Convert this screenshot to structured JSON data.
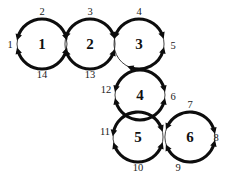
{
  "figure": {
    "background_color": "#ffffff",
    "ink_color": "#0d0d0d",
    "width": 226,
    "height": 182,
    "circle_radius": 25,
    "node_font_size": 15,
    "label_font_size": 10.5
  },
  "circles": [
    {
      "id": "c1",
      "label": "1",
      "cx": 42,
      "cy": 44,
      "r": 25
    },
    {
      "id": "c2",
      "label": "2",
      "cx": 90,
      "cy": 44,
      "r": 25
    },
    {
      "id": "c3",
      "label": "3",
      "cx": 139,
      "cy": 44,
      "r": 25
    },
    {
      "id": "c4",
      "label": "4",
      "cx": 140,
      "cy": 95,
      "r": 25
    },
    {
      "id": "c5",
      "label": "5",
      "cx": 138,
      "cy": 137,
      "r": 25
    },
    {
      "id": "c6",
      "label": "6",
      "cx": 190,
      "cy": 137,
      "r": 25
    }
  ],
  "edge_labels": [
    {
      "id": "e1",
      "label": "1",
      "x": 10,
      "y": 44,
      "circle": "c1",
      "side": "left"
    },
    {
      "id": "e2",
      "label": "2",
      "x": 42,
      "y": 11,
      "circle": "c1",
      "side": "top"
    },
    {
      "id": "e3",
      "label": "3",
      "x": 90,
      "y": 11,
      "circle": "c2",
      "side": "top"
    },
    {
      "id": "e4",
      "label": "4",
      "x": 139,
      "y": 11,
      "circle": "c3",
      "side": "top"
    },
    {
      "id": "e5",
      "label": "5",
      "x": 173,
      "y": 45,
      "circle": "c3",
      "side": "right"
    },
    {
      "id": "e6",
      "label": "6",
      "x": 173,
      "y": 96,
      "circle": "c4",
      "side": "right"
    },
    {
      "id": "e7",
      "label": "7",
      "x": 190,
      "y": 104,
      "circle": "c6",
      "side": "top"
    },
    {
      "id": "e8",
      "label": "8",
      "x": 216,
      "y": 137,
      "circle": "c6",
      "side": "right"
    },
    {
      "id": "e9",
      "label": "9",
      "x": 178,
      "y": 167,
      "circle": "c6",
      "side": "bottom"
    },
    {
      "id": "e10",
      "label": "10",
      "x": 138,
      "y": 167,
      "circle": "c5",
      "side": "bottom"
    },
    {
      "id": "e11",
      "label": "11",
      "x": 105,
      "y": 131,
      "circle": "c5",
      "side": "left"
    },
    {
      "id": "e12",
      "label": "12",
      "x": 106,
      "y": 89,
      "circle": "c4",
      "side": "left"
    },
    {
      "id": "e13",
      "label": "13",
      "x": 90,
      "y": 74,
      "circle": "c2",
      "side": "bottom"
    },
    {
      "id": "e14",
      "label": "14",
      "x": 42,
      "y": 74,
      "circle": "c1",
      "side": "bottom"
    }
  ],
  "arc_geometry": {
    "note": "Each circle is drawn as thick arcs terminated by double arrowheads, with thin arcs near tangent contact points.",
    "c1": {
      "thick": [
        [
          196,
          344
        ],
        [
          16,
          164
        ]
      ],
      "thin": [
        [
          344,
          16
        ],
        [
          164,
          196
        ]
      ]
    },
    "c2": {
      "thick": [
        [
          200,
          340
        ],
        [
          20,
          160
        ]
      ],
      "thin": [
        [
          340,
          20
        ],
        [
          160,
          200
        ]
      ]
    },
    "c3": {
      "thick": [
        [
          200,
          340
        ],
        [
          15,
          110
        ]
      ],
      "thin": [
        [
          340,
          20
        ],
        [
          110,
          200
        ]
      ]
    },
    "c4": {
      "thick": [
        [
          195,
          345
        ],
        [
          15,
          165
        ]
      ],
      "thin": [
        [
          345,
          15
        ],
        [
          165,
          195
        ]
      ]
    },
    "c5": {
      "thick": [
        [
          190,
          340
        ],
        [
          20,
          160
        ]
      ],
      "thin": [
        [
          340,
          20
        ],
        [
          160,
          190
        ]
      ]
    },
    "c6": {
      "thick": [
        [
          205,
          345
        ],
        [
          15,
          155
        ]
      ],
      "thin": [
        [
          345,
          15
        ],
        [
          155,
          205
        ]
      ]
    }
  }
}
